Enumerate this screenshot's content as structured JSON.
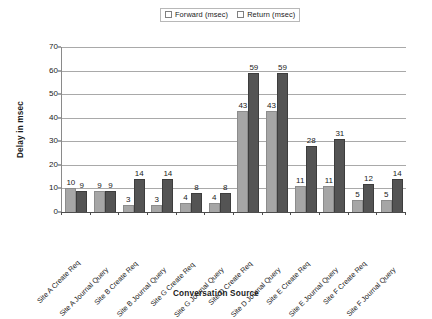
{
  "chart_data": {
    "type": "bar",
    "title": "",
    "xlabel": "Conversation Source",
    "ylabel": "Delay in msec",
    "ylim": [
      0,
      70
    ],
    "ytick_step": 10,
    "yticks": [
      0,
      10,
      20,
      30,
      40,
      50,
      60,
      70
    ],
    "grid": true,
    "legend_position": "top-center",
    "categories": [
      "Site A Create Req",
      "Site A Journal Query",
      "Site B Create Req",
      "Site B Journal Query",
      "Site G Create Req",
      "Site G Journal Query",
      "Site D Create Req",
      "Site D Journal Query",
      "Site E Create Req",
      "Site E Journal Query",
      "Site F Create Req",
      "Site F Journal Query"
    ],
    "series": [
      {
        "name": "Forward (msec)",
        "color": "#a6a6a6",
        "values": [
          10,
          9,
          3,
          3,
          4,
          4,
          43,
          43,
          11,
          11,
          5,
          5
        ]
      },
      {
        "name": "Return (msec)",
        "color": "#545454",
        "values": [
          9,
          9,
          14,
          14,
          8,
          8,
          59,
          59,
          28,
          31,
          12,
          14
        ]
      }
    ]
  },
  "legend": {
    "entries": [
      {
        "label": "Forward (msec)"
      },
      {
        "label": "Return (msec)"
      }
    ]
  },
  "axes": {
    "y_title": "Delay in msec",
    "x_title": "Conversation Source"
  }
}
